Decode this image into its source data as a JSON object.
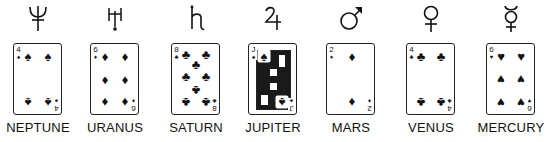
{
  "planets": [
    {
      "name": "NEPTUNE",
      "symbol": "♆",
      "symbol_icon": "neptune-icon",
      "card": {
        "rank": "4",
        "suit": "♠",
        "suit_name": "spades"
      }
    },
    {
      "name": "URANUS",
      "symbol": "♅",
      "symbol_icon": "uranus-icon",
      "card": {
        "rank": "6",
        "suit": "♦",
        "suit_name": "diamonds"
      }
    },
    {
      "name": "SATURN",
      "symbol": "♄",
      "symbol_icon": "saturn-icon",
      "card": {
        "rank": "8",
        "suit": "♣",
        "suit_name": "clubs"
      }
    },
    {
      "name": "JUPITER",
      "symbol": "♃",
      "symbol_icon": "jupiter-icon",
      "card": {
        "rank": "J",
        "suit": "♠",
        "suit_name": "spades"
      }
    },
    {
      "name": "MARS",
      "symbol": "♂",
      "symbol_icon": "mars-icon",
      "card": {
        "rank": "2",
        "suit": "♦",
        "suit_name": "diamonds"
      }
    },
    {
      "name": "VENUS",
      "symbol": "♀",
      "symbol_icon": "venus-icon",
      "card": {
        "rank": "4",
        "suit": "♣",
        "suit_name": "clubs"
      }
    },
    {
      "name": "MERCURY",
      "symbol": "☿",
      "symbol_icon": "mercury-icon",
      "card": {
        "rank": "6",
        "suit": "♥",
        "suit_name": "hearts"
      }
    }
  ]
}
